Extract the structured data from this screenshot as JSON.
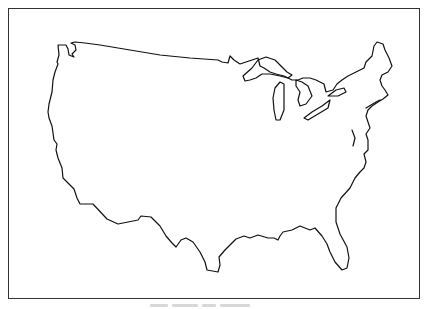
{
  "map": {
    "title": "United States outline map",
    "region": "Contiguous United States",
    "style": "black outline on white",
    "stroke_color": "#111111",
    "frame_color": "#333333",
    "background": "#ffffff",
    "features": [
      "Pacific coast",
      "Great Lakes",
      "New England",
      "Atlantic coast",
      "Florida",
      "Gulf coast",
      "Texas",
      "Mexican border",
      "Canadian border"
    ]
  },
  "caption": {
    "text": ""
  }
}
